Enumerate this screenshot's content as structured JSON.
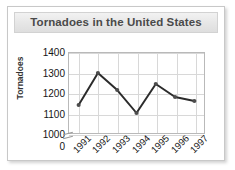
{
  "figure": {
    "title": "Tornadoes in the United States",
    "line_color": "#2b2b2b",
    "marker_color": "#4d4d4d",
    "grid_color": "#d8d8d8",
    "title_bg": "#e6e6e6",
    "title_color": "#4a4a4a"
  },
  "chart_data": {
    "type": "line",
    "title": "Tornadoes in the United States",
    "xlabel": "",
    "ylabel": "Tornadoes",
    "categories": [
      "1991",
      "1992",
      "1993",
      "1994",
      "1995",
      "1996",
      "1997"
    ],
    "values": [
      1140,
      1300,
      1215,
      1100,
      1245,
      1180,
      1160
    ],
    "series": [
      {
        "name": "Tornadoes",
        "values": [
          1140,
          1300,
          1215,
          1100,
          1245,
          1180,
          1160
        ]
      }
    ],
    "yticks": [
      "0",
      "1000",
      "1100",
      "1200",
      "1300",
      "1400"
    ],
    "ytick_values": [
      0,
      1000,
      1100,
      1200,
      1300,
      1400
    ],
    "ylim": [
      1000,
      1400
    ],
    "y_axis_break": true,
    "grid": true,
    "legend": "none",
    "markers": true
  }
}
